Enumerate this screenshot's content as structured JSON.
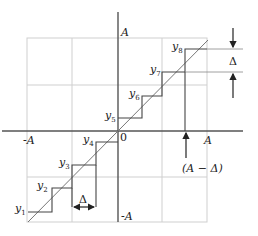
{
  "diagram": {
    "type": "quantizer staircase transfer characteristic",
    "axis_labels": {
      "y_top": "A",
      "y_bottom": "-A",
      "x_left": "-A",
      "x_right": "A",
      "origin": "0"
    },
    "levels": [
      {
        "name": "y",
        "sub": "1"
      },
      {
        "name": "y",
        "sub": "2"
      },
      {
        "name": "y",
        "sub": "3"
      },
      {
        "name": "y",
        "sub": "4"
      },
      {
        "name": "y",
        "sub": "5"
      },
      {
        "name": "y",
        "sub": "6"
      },
      {
        "name": "y",
        "sub": "7"
      },
      {
        "name": "y",
        "sub": "8"
      }
    ],
    "annotations": {
      "step_height": "Δ",
      "step_width": "Δ",
      "threshold": "(A − Δ)"
    },
    "colors": {
      "grid": "#cfcfcf",
      "axis": "#555555",
      "staircase": "#444444",
      "diagonal": "#777777"
    }
  }
}
